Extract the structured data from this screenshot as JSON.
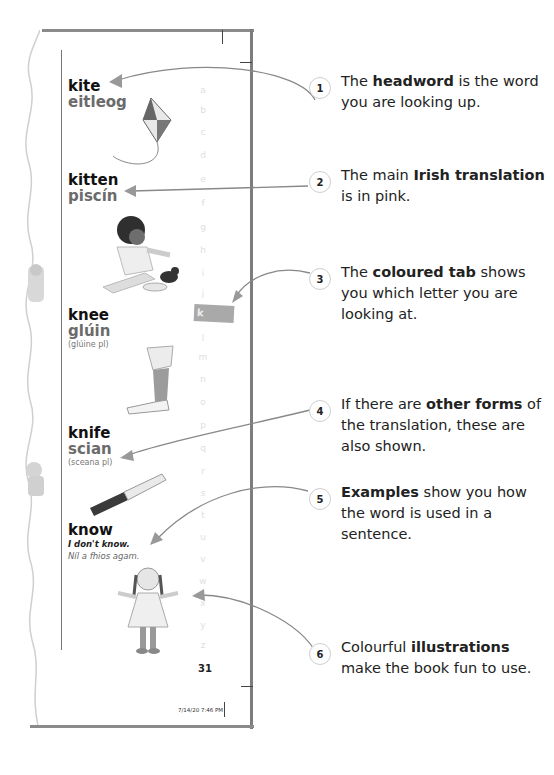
{
  "dictionary_page": {
    "page_number": "31",
    "print_timestamp": "7/14/20   7:46 PM",
    "alphabet_tab": {
      "letter": "k",
      "color": "#a9a9a9"
    },
    "alphabet_margin": [
      "a",
      "b",
      "c",
      "d",
      "e",
      "f",
      "g",
      "h",
      "i",
      "j",
      "l",
      "m",
      "n",
      "o",
      "p",
      "q",
      "r",
      "s",
      "t",
      "u",
      "v",
      "w",
      "x",
      "y",
      "z"
    ],
    "entries": [
      {
        "headword": "kite",
        "translation": "eitleog",
        "illustration": "kite-illustration"
      },
      {
        "headword": "kitten",
        "translation": "piscín",
        "illustration": "child-with-kitten-illustration"
      },
      {
        "headword": "knee",
        "translation": "glúin",
        "plural_form": "(glúine pl)",
        "illustration": "leg-illustration"
      },
      {
        "headword": "knife",
        "translation": "scian",
        "plural_form": "(sceana pl)",
        "illustration": "knife-illustration"
      },
      {
        "headword": "know",
        "example_en": "I don't know.",
        "example_ga": "Níl a fhios agam.",
        "illustration": "shrugging-girl-illustration"
      }
    ]
  },
  "callouts": [
    {
      "number": "1",
      "pre": "The ",
      "bold": "headword",
      "post": " is the word you are looking up."
    },
    {
      "number": "2",
      "pre": "The main ",
      "bold": "Irish translation",
      "post": " is in pink."
    },
    {
      "number": "3",
      "pre": "The ",
      "bold": "coloured tab",
      "post": " shows you which letter you are looking at."
    },
    {
      "number": "4",
      "pre": "If there are ",
      "bold": "other forms",
      "post": " of the translation, these are also shown."
    },
    {
      "number": "5",
      "pre": "",
      "bold": "Examples",
      "post": " show you how the word is used in a sentence."
    },
    {
      "number": "6",
      "pre": "Colourful ",
      "bold": "illustrations",
      "post": " make the book fun to use."
    }
  ],
  "colors": {
    "translation": "#6b6b6b",
    "arrow": "#888888",
    "circle_border": "#cfcfcf"
  }
}
